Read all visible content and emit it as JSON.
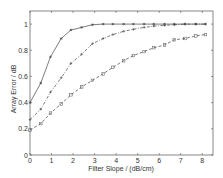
{
  "chart_data": {
    "type": "line",
    "title": "",
    "xlabel": "Filter Slope / (dB/cm)",
    "ylabel": "Array Error / dB",
    "xlim": [
      0,
      8.5
    ],
    "ylim": [
      0,
      1.1
    ],
    "xticks": [
      "0",
      "1",
      "2",
      "3",
      "4",
      "5",
      "6",
      "7",
      "8"
    ],
    "yticks": [
      "0",
      "0.2",
      "0.4",
      "0.6",
      "0.8",
      "1"
    ],
    "grid": false,
    "legend": null,
    "series": [
      {
        "name": "solid-star",
        "style": "solid",
        "marker": "*",
        "x": [
          0,
          0.5,
          0.95,
          1.45,
          1.9,
          2.4,
          2.9,
          3.4,
          3.85,
          4.35,
          4.8,
          5.3,
          5.75,
          6.25,
          6.7,
          7.2,
          7.7,
          8.15
        ],
        "values": [
          0.4,
          0.55,
          0.75,
          0.89,
          0.955,
          0.975,
          0.995,
          1.0,
          1.0,
          1.0,
          1.0,
          1.0,
          1.0,
          1.0,
          1.0,
          1.0,
          1.0,
          1.0
        ]
      },
      {
        "name": "dashdot-plus",
        "style": "dashdot",
        "marker": "+",
        "x": [
          0,
          0.5,
          0.95,
          1.45,
          1.9,
          2.4,
          2.9,
          3.4,
          3.85,
          4.35,
          4.8,
          5.3,
          5.75,
          6.25,
          6.7,
          7.2,
          7.7,
          8.15
        ],
        "values": [
          0.27,
          0.35,
          0.48,
          0.59,
          0.7,
          0.77,
          0.85,
          0.89,
          0.92,
          0.945,
          0.96,
          0.975,
          0.985,
          0.99,
          0.995,
          1.0,
          1.0,
          1.0
        ]
      },
      {
        "name": "dashed-square",
        "style": "dashed",
        "marker": "square",
        "x": [
          0,
          0.5,
          0.95,
          1.45,
          1.9,
          2.4,
          2.9,
          3.4,
          3.85,
          4.35,
          4.8,
          5.3,
          5.75,
          6.25,
          6.7,
          7.2,
          7.7,
          8.15
        ],
        "values": [
          0.19,
          0.24,
          0.32,
          0.39,
          0.46,
          0.52,
          0.57,
          0.62,
          0.67,
          0.72,
          0.76,
          0.79,
          0.82,
          0.84,
          0.88,
          0.89,
          0.91,
          0.92
        ]
      }
    ]
  }
}
